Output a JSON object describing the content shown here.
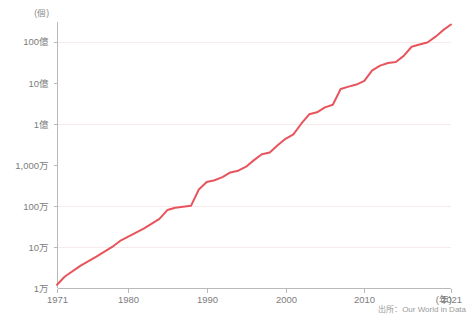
{
  "chart_data": {
    "type": "line",
    "title": "",
    "subtitle": "",
    "xlabel": "(年)",
    "ylabel": "(個)",
    "yscale": "log",
    "ylim": [
      10000,
      30000000000
    ],
    "xlim": [
      1971,
      2021
    ],
    "grid": true,
    "legend_position": "none",
    "source_note": "出所：Our World in Data",
    "y_unit_label": "(個)",
    "x_unit_label": "(年)",
    "y_ticks": [
      {
        "value": 10000,
        "label": "1万"
      },
      {
        "value": 100000,
        "label": "10万"
      },
      {
        "value": 1000000,
        "label": "100万"
      },
      {
        "value": 10000000,
        "label": "1,000万"
      },
      {
        "value": 100000000,
        "label": "1億"
      },
      {
        "value": 1000000000,
        "label": "10億"
      },
      {
        "value": 10000000000,
        "label": "100億"
      }
    ],
    "x_ticks": [
      {
        "value": 1971,
        "label": "1971"
      },
      {
        "value": 1980,
        "label": "1980"
      },
      {
        "value": 1990,
        "label": "1990"
      },
      {
        "value": 2000,
        "label": "2000"
      },
      {
        "value": 2010,
        "label": "2010"
      },
      {
        "value": 2021,
        "label": "2021"
      }
    ],
    "series": [
      {
        "name": "transistor-count",
        "color": "#e8545c",
        "x": [
          1971,
          1972,
          1974,
          1976,
          1978,
          1979,
          1982,
          1984,
          1985,
          1986,
          1987,
          1988,
          1989,
          1990,
          1991,
          1992,
          1993,
          1994,
          1995,
          1996,
          1997,
          1998,
          1999,
          2000,
          2001,
          2002,
          2003,
          2004,
          2005,
          2006,
          2007,
          2008,
          2009,
          2010,
          2011,
          2012,
          2013,
          2014,
          2015,
          2016,
          2017,
          2018,
          2019,
          2020,
          2021
        ],
        "y": [
          12000,
          19000,
          35000,
          58000,
          100000,
          140000,
          280000,
          480000,
          790000,
          900000,
          950000,
          1000000,
          2500000,
          3800000,
          4200000,
          5000000,
          6500000,
          7200000,
          9000000,
          13000000,
          18000000,
          20000000,
          30000000,
          43000000,
          55000000,
          100000000,
          170000000,
          190000000,
          250000000,
          290000000,
          700000000,
          800000000,
          900000000,
          1100000000,
          2000000000,
          2600000000,
          3000000000,
          3200000000,
          4500000000,
          7500000000,
          8500000000,
          9500000000,
          13000000000,
          19000000000,
          26000000000
        ]
      }
    ]
  },
  "layout": {
    "plot_left": 57,
    "plot_right": 451,
    "plot_top": 22,
    "plot_bottom": 288
  }
}
